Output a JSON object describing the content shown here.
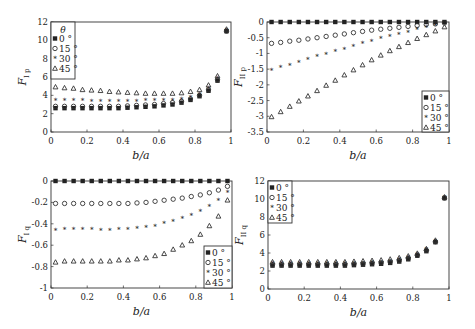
{
  "figure": {
    "panel_labels": [
      "F_Ip",
      "F_IIp",
      "F_Iq",
      "F_IIq"
    ]
  },
  "chart_data": [
    {
      "id": "tl",
      "type": "scatter",
      "title": "",
      "xlabel": "b/a",
      "ylabel": "F",
      "ylabel_sub": "I p",
      "xlim": [
        0,
        1
      ],
      "ylim": [
        0,
        12
      ],
      "xticks": [
        0,
        0.2,
        0.4,
        0.6,
        0.8,
        1
      ],
      "xtick_labels": [
        "0",
        "0.2",
        "0.4",
        "0.6",
        "0.8",
        "1"
      ],
      "yticks": [
        0,
        2,
        4,
        6,
        8,
        10,
        12
      ],
      "ytick_labels": [
        "0",
        "2",
        "4",
        "6",
        "8",
        "10",
        "12"
      ],
      "grid": false,
      "legend": {
        "position": "upper-left",
        "title": "θ",
        "entries": [
          "0 °",
          "15 °",
          "30 °",
          "45 °"
        ]
      },
      "x": [
        0.025,
        0.075,
        0.125,
        0.175,
        0.225,
        0.275,
        0.325,
        0.375,
        0.425,
        0.475,
        0.525,
        0.575,
        0.625,
        0.675,
        0.725,
        0.775,
        0.825,
        0.875,
        0.925,
        0.975
      ],
      "series": [
        {
          "name": "0°",
          "marker": "square",
          "values": [
            2.6,
            2.6,
            2.6,
            2.6,
            2.6,
            2.6,
            2.6,
            2.6,
            2.65,
            2.7,
            2.75,
            2.8,
            2.9,
            3.0,
            3.2,
            3.5,
            3.9,
            4.5,
            5.6,
            11.0
          ]
        },
        {
          "name": "15°",
          "marker": "circle",
          "values": [
            2.8,
            2.8,
            2.8,
            2.8,
            2.8,
            2.8,
            2.8,
            2.8,
            2.85,
            2.9,
            2.95,
            3.0,
            3.1,
            3.2,
            3.35,
            3.6,
            4.0,
            4.6,
            5.7,
            11.0
          ]
        },
        {
          "name": "30°",
          "marker": "star",
          "values": [
            3.4,
            3.4,
            3.4,
            3.4,
            3.35,
            3.35,
            3.35,
            3.35,
            3.35,
            3.35,
            3.4,
            3.4,
            3.45,
            3.5,
            3.6,
            3.8,
            4.1,
            4.8,
            5.9,
            11.1
          ]
        },
        {
          "name": "45°",
          "marker": "triangle",
          "values": [
            4.9,
            4.8,
            4.75,
            4.6,
            4.55,
            4.5,
            4.4,
            4.35,
            4.3,
            4.25,
            4.2,
            4.2,
            4.2,
            4.2,
            4.25,
            4.4,
            4.6,
            5.1,
            6.1,
            11.2
          ]
        }
      ]
    },
    {
      "id": "tr",
      "type": "scatter",
      "title": "",
      "xlabel": "b/a",
      "ylabel": "F",
      "ylabel_sub": "II p",
      "xlim": [
        0,
        1
      ],
      "ylim": [
        -3.5,
        0
      ],
      "xticks": [
        0,
        0.2,
        0.4,
        0.6,
        0.8,
        1
      ],
      "xtick_labels": [
        "0",
        "0.2",
        "0.4",
        "0.6",
        "0.8",
        "1"
      ],
      "yticks": [
        -3.5,
        -3,
        -2.5,
        -2,
        -1.5,
        -1,
        -0.5,
        0
      ],
      "ytick_labels": [
        "-3.5",
        "-3",
        "-2.5",
        "-2",
        "-1.5",
        "-1",
        "-0.5",
        "0"
      ],
      "grid": false,
      "legend": {
        "position": "lower-right",
        "title": "",
        "entries": [
          "0 °",
          "15 °",
          "30 °",
          "45 °"
        ]
      },
      "x": [
        0.025,
        0.075,
        0.125,
        0.175,
        0.225,
        0.275,
        0.325,
        0.375,
        0.425,
        0.475,
        0.525,
        0.575,
        0.625,
        0.675,
        0.725,
        0.775,
        0.825,
        0.875,
        0.925,
        0.975
      ],
      "series": [
        {
          "name": "0°",
          "marker": "square",
          "values": [
            0,
            0,
            0,
            0,
            0,
            0,
            0,
            0,
            0,
            0,
            0,
            0,
            0,
            0,
            0,
            0,
            0,
            0,
            0,
            0
          ]
        },
        {
          "name": "15°",
          "marker": "circle",
          "values": [
            -0.68,
            -0.65,
            -0.61,
            -0.58,
            -0.54,
            -0.5,
            -0.46,
            -0.42,
            -0.38,
            -0.34,
            -0.3,
            -0.26,
            -0.23,
            -0.2,
            -0.17,
            -0.14,
            -0.11,
            -0.08,
            -0.06,
            -0.03
          ]
        },
        {
          "name": "30°",
          "marker": "star",
          "values": [
            -1.55,
            -1.45,
            -1.37,
            -1.28,
            -1.2,
            -1.11,
            -1.02,
            -0.94,
            -0.86,
            -0.77,
            -0.69,
            -0.61,
            -0.53,
            -0.46,
            -0.39,
            -0.32,
            -0.25,
            -0.18,
            -0.12,
            -0.06
          ]
        },
        {
          "name": "45°",
          "marker": "triangle",
          "values": [
            -3.02,
            -2.86,
            -2.69,
            -2.52,
            -2.36,
            -2.19,
            -2.02,
            -1.86,
            -1.69,
            -1.53,
            -1.37,
            -1.21,
            -1.06,
            -0.92,
            -0.79,
            -0.66,
            -0.53,
            -0.41,
            -0.29,
            -0.16
          ]
        }
      ]
    },
    {
      "id": "bl",
      "type": "scatter",
      "title": "",
      "xlabel": "b/a",
      "ylabel": "F",
      "ylabel_sub": "I q",
      "xlim": [
        0,
        1
      ],
      "ylim": [
        -1,
        0
      ],
      "xticks": [
        0,
        0.2,
        0.4,
        0.6,
        0.8,
        1
      ],
      "xtick_labels": [
        "0",
        "0.2",
        "0.4",
        "0.6",
        "0.8",
        "1"
      ],
      "yticks": [
        -1,
        -0.8,
        -0.6,
        -0.4,
        -0.2,
        0
      ],
      "ytick_labels": [
        "-1",
        "-0.8",
        "-0.6",
        "-0.4",
        "-0.2",
        "0"
      ],
      "grid": false,
      "legend": {
        "position": "lower-right",
        "title": "",
        "entries": [
          "0 °",
          "15 °",
          "30 °",
          "45 °"
        ]
      },
      "x": [
        0.025,
        0.075,
        0.125,
        0.175,
        0.225,
        0.275,
        0.325,
        0.375,
        0.425,
        0.475,
        0.525,
        0.575,
        0.625,
        0.675,
        0.725,
        0.775,
        0.825,
        0.875,
        0.925,
        0.975
      ],
      "series": [
        {
          "name": "0°",
          "marker": "square",
          "values": [
            0,
            0,
            0,
            0,
            0,
            0,
            0,
            0,
            0,
            0,
            0,
            0,
            0,
            0,
            0,
            0,
            0,
            0,
            0,
            0
          ]
        },
        {
          "name": "15°",
          "marker": "circle",
          "values": [
            -0.21,
            -0.21,
            -0.21,
            -0.21,
            -0.21,
            -0.21,
            -0.21,
            -0.21,
            -0.21,
            -0.205,
            -0.2,
            -0.19,
            -0.18,
            -0.17,
            -0.16,
            -0.145,
            -0.13,
            -0.11,
            -0.085,
            -0.05
          ]
        },
        {
          "name": "30°",
          "marker": "star",
          "values": [
            -0.46,
            -0.45,
            -0.45,
            -0.45,
            -0.45,
            -0.46,
            -0.46,
            -0.45,
            -0.45,
            -0.44,
            -0.43,
            -0.42,
            -0.4,
            -0.38,
            -0.35,
            -0.32,
            -0.28,
            -0.24,
            -0.18,
            -0.11
          ]
        },
        {
          "name": "45°",
          "marker": "triangle",
          "values": [
            -0.76,
            -0.75,
            -0.75,
            -0.75,
            -0.75,
            -0.75,
            -0.75,
            -0.74,
            -0.74,
            -0.73,
            -0.72,
            -0.7,
            -0.68,
            -0.64,
            -0.6,
            -0.56,
            -0.5,
            -0.42,
            -0.33,
            -0.18
          ]
        }
      ]
    },
    {
      "id": "br",
      "type": "scatter",
      "title": "",
      "xlabel": "b/a",
      "ylabel": "F",
      "ylabel_sub": "II q",
      "xlim": [
        0,
        1
      ],
      "ylim": [
        0,
        12
      ],
      "xticks": [
        0,
        0.2,
        0.4,
        0.6,
        0.8,
        1
      ],
      "xtick_labels": [
        "0",
        "0.2",
        "0.4",
        "0.6",
        "0.8",
        "1"
      ],
      "yticks": [
        0,
        2,
        4,
        6,
        8,
        10,
        12
      ],
      "ytick_labels": [
        "0",
        "2",
        "4",
        "6",
        "8",
        "10",
        "12"
      ],
      "grid": false,
      "legend": {
        "position": "upper-left",
        "title": "",
        "entries": [
          "0 °",
          "15 °",
          "30 °",
          "45 °"
        ]
      },
      "x": [
        0.025,
        0.075,
        0.125,
        0.175,
        0.225,
        0.275,
        0.325,
        0.375,
        0.425,
        0.475,
        0.525,
        0.575,
        0.625,
        0.675,
        0.725,
        0.775,
        0.825,
        0.875,
        0.925,
        0.975
      ],
      "series": [
        {
          "name": "0°",
          "marker": "square",
          "values": [
            2.6,
            2.6,
            2.6,
            2.6,
            2.6,
            2.6,
            2.6,
            2.6,
            2.6,
            2.65,
            2.7,
            2.75,
            2.8,
            2.9,
            3.05,
            3.3,
            3.7,
            4.2,
            5.2,
            10.1
          ]
        },
        {
          "name": "15°",
          "marker": "circle",
          "values": [
            2.7,
            2.7,
            2.7,
            2.7,
            2.7,
            2.7,
            2.7,
            2.7,
            2.7,
            2.75,
            2.8,
            2.85,
            2.9,
            3.0,
            3.15,
            3.4,
            3.75,
            4.3,
            5.25,
            10.1
          ]
        },
        {
          "name": "30°",
          "marker": "star",
          "values": [
            2.8,
            2.8,
            2.8,
            2.8,
            2.8,
            2.8,
            2.8,
            2.8,
            2.8,
            2.85,
            2.9,
            2.95,
            3.0,
            3.1,
            3.25,
            3.5,
            3.85,
            4.35,
            5.3,
            10.15
          ]
        },
        {
          "name": "45°",
          "marker": "triangle",
          "values": [
            3.0,
            3.0,
            3.0,
            3.0,
            3.0,
            3.0,
            3.0,
            3.0,
            3.0,
            3.05,
            3.1,
            3.15,
            3.2,
            3.3,
            3.45,
            3.65,
            3.95,
            4.45,
            5.4,
            10.2
          ]
        }
      ]
    }
  ]
}
